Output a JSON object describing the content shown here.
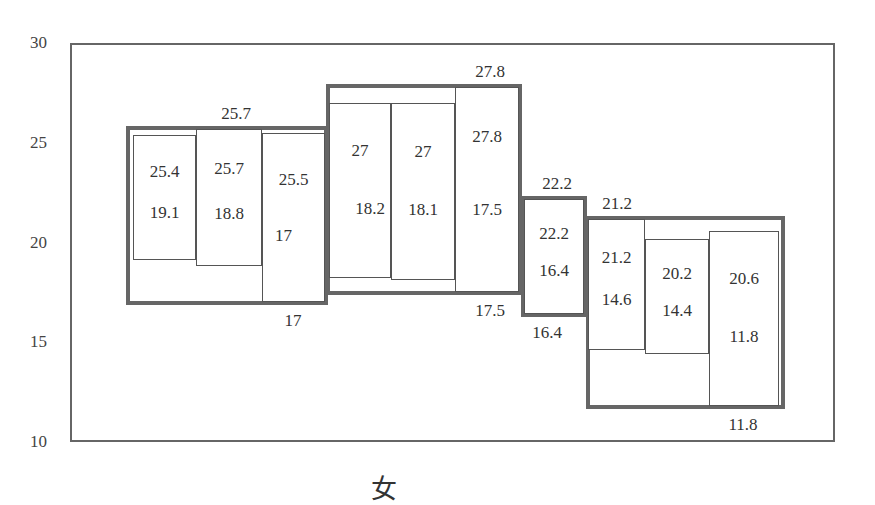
{
  "chart_data": {
    "type": "box",
    "title": "",
    "xlabel": "女",
    "ylabel": "",
    "ylim": [
      10,
      30
    ],
    "yticks": [
      10,
      15,
      20,
      25,
      30
    ],
    "grid": false,
    "legend": null,
    "groups": [
      {
        "name": "group-1",
        "outer": {
          "high": 25.7,
          "low": 17
        },
        "bars": [
          {
            "high": 25.4,
            "low": 19.1
          },
          {
            "high": 25.7,
            "low": 18.8
          },
          {
            "high": 25.5,
            "low": 17
          }
        ]
      },
      {
        "name": "group-2",
        "outer": {
          "high": 27.8,
          "low": 17.5
        },
        "bars": [
          {
            "high": 27,
            "low": 18.2
          },
          {
            "high": 27,
            "low": 18.1
          },
          {
            "high": 27.8,
            "low": 17.5
          }
        ]
      },
      {
        "name": "group-3",
        "outer": {
          "high": 22.2,
          "low": 16.4
        },
        "bars": [
          {
            "high": 22.2,
            "low": 16.4
          }
        ]
      },
      {
        "name": "group-4",
        "outer": {
          "high": 21.2,
          "low": 11.8
        },
        "bars": [
          {
            "high": 21.2,
            "low": 14.6
          },
          {
            "high": 20.2,
            "low": 14.4
          },
          {
            "high": 20.6,
            "low": 11.8
          }
        ]
      }
    ],
    "colors": {
      "outer_border": "#666666",
      "inner_border": "#555555",
      "text": "#333333"
    }
  },
  "layout": {
    "plot": {
      "left": 70,
      "top": 43,
      "right": 835,
      "bottom": 442
    },
    "groups_px": [
      {
        "outer": [
          126,
          328
        ],
        "bars": [
          [
            133,
            196
          ],
          [
            196,
            262
          ],
          [
            262,
            325
          ]
        ],
        "outer_high_label_x": 236,
        "outer_low_label_x": 293
      },
      {
        "outer": [
          326,
          522
        ],
        "bars": [
          [
            329,
            391
          ],
          [
            391,
            455
          ],
          [
            455,
            519
          ]
        ],
        "outer_high_label_x": 490,
        "outer_low_label_x": 490
      },
      {
        "outer": [
          521,
          587
        ],
        "bars": [
          [
            524,
            584
          ]
        ],
        "outer_high_label_x": 557,
        "outer_low_label_x": 547
      },
      {
        "outer": [
          586,
          785
        ],
        "bars": [
          [
            588,
            645
          ],
          [
            645,
            709
          ],
          [
            709,
            779
          ]
        ],
        "outer_high_label_x": 617,
        "outer_low_label_x": 743
      }
    ],
    "xlabel_pos": [
      384,
      486
    ]
  }
}
